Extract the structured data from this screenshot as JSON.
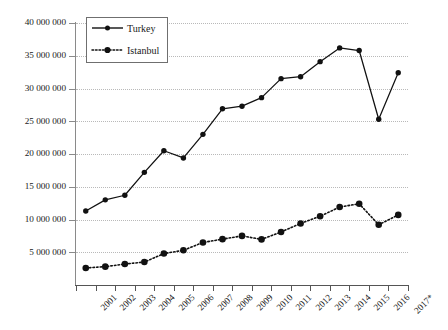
{
  "chart_data": {
    "type": "line",
    "title": "",
    "subtitle": "",
    "xlabel": "",
    "ylabel": "",
    "grid": true,
    "legend_position": "top-left",
    "ylim": [
      0,
      40000000
    ],
    "ytick_step": 5000000,
    "ytick_labels": [
      "40 000 000",
      "35 000 000",
      "30 000 000",
      "25 000 000",
      "20 000 000",
      "15 000 000",
      "10 000 000",
      "5 000 000"
    ],
    "ytick_values": [
      40000000,
      35000000,
      30000000,
      25000000,
      20000000,
      15000000,
      10000000,
      5000000
    ],
    "categories": [
      "2001",
      "2002",
      "2003",
      "2004",
      "2005",
      "2006",
      "2007",
      "2008",
      "2009",
      "2010",
      "2011",
      "2012",
      "2013",
      "2014",
      "2015",
      "2016",
      "2017*"
    ],
    "series": [
      {
        "name": "Turkey",
        "line_style": "solid",
        "marker": "circle",
        "color": "#111111",
        "values": [
          11300000,
          13000000,
          13700000,
          17200000,
          20500000,
          19400000,
          23000000,
          26900000,
          27300000,
          28600000,
          31500000,
          31800000,
          34100000,
          36200000,
          35800000,
          25300000,
          32400000
        ]
      },
      {
        "name": "Istanbul",
        "line_style": "dotted",
        "marker": "circle",
        "color": "#111111",
        "values": [
          2600000,
          2800000,
          3200000,
          3500000,
          4800000,
          5300000,
          6500000,
          7000000,
          7500000,
          6960000,
          8100000,
          9400000,
          10500000,
          11900000,
          12400000,
          9200000,
          10700000
        ]
      }
    ],
    "annotations": []
  },
  "legend": {
    "items": [
      {
        "label": "Turkey",
        "style": "solid"
      },
      {
        "label": "Istanbul",
        "style": "dotted"
      }
    ]
  }
}
